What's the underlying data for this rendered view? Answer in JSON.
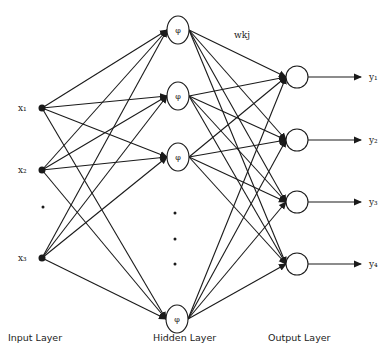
{
  "diagram": {
    "weight_label": "wkj",
    "activation_symbol": "φ",
    "layers": {
      "input": {
        "label": "Input Layer",
        "nodes": [
          {
            "label": "x₁",
            "x": 42,
            "y": 108
          },
          {
            "label": "x₂",
            "x": 42,
            "y": 170
          },
          {
            "label": "x₃",
            "x": 42,
            "y": 258
          }
        ],
        "ellipsis_dots": [
          {
            "x": 43,
            "y": 207
          }
        ]
      },
      "hidden": {
        "label": "Hidden Layer",
        "nodes": [
          {
            "x": 178,
            "y": 30
          },
          {
            "x": 178,
            "y": 96
          },
          {
            "x": 178,
            "y": 157
          },
          {
            "x": 177,
            "y": 319
          }
        ],
        "ellipsis_dots": [
          {
            "x": 175,
            "y": 213
          },
          {
            "x": 175,
            "y": 239
          },
          {
            "x": 175,
            "y": 264
          }
        ]
      },
      "output": {
        "label": "Output Layer",
        "nodes": [
          {
            "label": "y₁",
            "x": 297,
            "y": 77
          },
          {
            "label": "y₂",
            "x": 297,
            "y": 140
          },
          {
            "label": "y₃",
            "x": 297,
            "y": 202
          },
          {
            "label": "y₄",
            "x": 297,
            "y": 264
          }
        ]
      }
    },
    "colors": {
      "line": "#1a1a1a",
      "background": "#ffffff"
    }
  }
}
